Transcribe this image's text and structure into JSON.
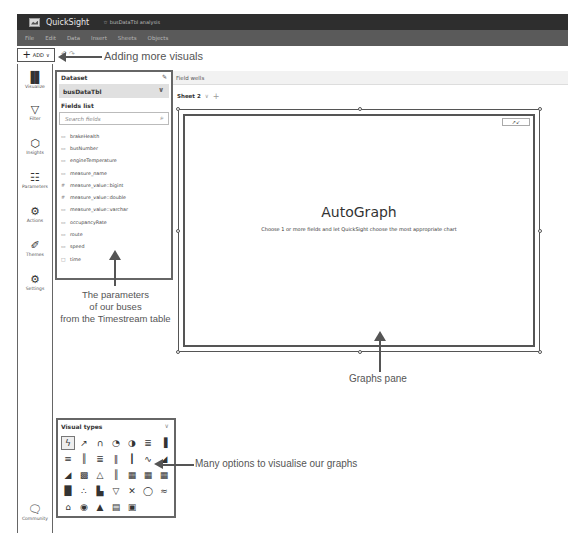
{
  "titlebar": {
    "app_name": "QuickSight",
    "analysis_name": "busDataTbl analysis"
  },
  "menubar": {
    "items": [
      "File",
      "Edit",
      "Data",
      "Insert",
      "Sheets",
      "Objects"
    ]
  },
  "toolbar": {
    "add_label": "ADD",
    "add_plus": "+",
    "add_chevron": "∨",
    "undo_icon": "↶ ↷"
  },
  "annotations": {
    "adding_visuals": "Adding more visuals",
    "parameters_line1": "The parameters",
    "parameters_line2": "of our buses",
    "parameters_line3": "from the Timestream table",
    "graphs_pane": "Graphs pane",
    "visual_options": "Many options to visualise our graphs"
  },
  "leftrail": {
    "items": [
      {
        "label": "Visualize",
        "icon": "▐▌"
      },
      {
        "label": "Filter",
        "icon": "▽"
      },
      {
        "label": "Insights",
        "icon": "⬡"
      },
      {
        "label": "Parameters",
        "icon": "☷"
      },
      {
        "label": "Actions",
        "icon": "⚙"
      },
      {
        "label": "Themes",
        "icon": "✐"
      },
      {
        "label": "Settings",
        "icon": "⚙"
      }
    ],
    "community": {
      "label": "Community",
      "icon": "🗨"
    }
  },
  "dataset": {
    "title": "Dataset",
    "edit_icon": "✎",
    "selected": "busDataTbl",
    "chevron": "∨",
    "fields_label": "Fields list",
    "search_placeholder": "Search fields",
    "search_icon": "⌕",
    "fields": [
      {
        "name": "brakeHealth",
        "type_icon": "▭"
      },
      {
        "name": "busNumber",
        "type_icon": "▭"
      },
      {
        "name": "engineTemperature",
        "type_icon": "▭"
      },
      {
        "name": "measure_name",
        "type_icon": "▭"
      },
      {
        "name": "measure_value::bigint",
        "type_icon": "#"
      },
      {
        "name": "measure_value::double",
        "type_icon": "#"
      },
      {
        "name": "measure_value::varchar",
        "type_icon": "▭"
      },
      {
        "name": "occupancyRate",
        "type_icon": "▭"
      },
      {
        "name": "route",
        "type_icon": "▭"
      },
      {
        "name": "speed",
        "type_icon": "▭"
      },
      {
        "name": "time",
        "type_icon": "□"
      }
    ]
  },
  "main": {
    "field_wells": "Field wells",
    "sheet_tab": "Sheet 2",
    "sheet_chevron": "∨",
    "sheet_add": "+",
    "expand_icon": "↗↙",
    "autograph_title": "AutoGraph",
    "autograph_subtitle": "Choose 1 or more fields and let QuickSight choose the most appropriate chart"
  },
  "visual_types": {
    "title": "Visual types",
    "chevron": "∨",
    "icons": [
      "ϟ",
      "↗",
      "∩",
      "◔",
      "◑",
      "≣",
      "▐",
      "≡",
      "║",
      "≣",
      "‖",
      "┃",
      "∿",
      "◢",
      "◢",
      "▩",
      "△",
      "║",
      "▦",
      "▦",
      "▦",
      "█",
      "∴",
      "▙",
      "▽",
      "✕",
      "◯",
      "≈",
      "⌂",
      "◉",
      "▲",
      "▤",
      "▣"
    ]
  }
}
